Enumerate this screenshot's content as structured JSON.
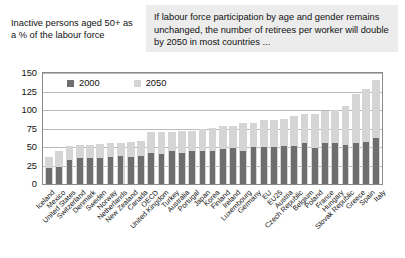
{
  "caption": "Inactive persons aged 50+ as a % of the labour force",
  "callout": "If labour force participation by age and gender remains unchanged, the number of retirees per worker will double by 2050 in most countries ...",
  "legend": [
    {
      "label": "2000",
      "color": "#6e6e6e"
    },
    {
      "label": "2050",
      "color": "#d5d5d5"
    }
  ],
  "colors": {
    "series_2000": "#6e6e6e",
    "series_2050": "#d5d5d5",
    "callout_bg": "#ececec",
    "gridline": "#b9b9b9",
    "frame": "#8a8a8a"
  },
  "chart_data": {
    "type": "bar",
    "title": "Inactive persons aged 50+ as a % of the labour force",
    "xlabel": "",
    "ylabel": "",
    "ylim": [
      0,
      150
    ],
    "yticks": [
      0,
      25,
      50,
      75,
      100,
      125,
      150
    ],
    "grid": true,
    "legend_position": "top-left",
    "categories": [
      "Iceland",
      "Mexico",
      "United States",
      "Switzerland",
      "Denmark",
      "Sweden",
      "Norway",
      "Netherlands",
      "New Zealand",
      "Canada",
      "OECD",
      "United Kingdom",
      "Turkey",
      "Australia",
      "Portugal",
      "Japan",
      "Korea",
      "Finland",
      "Ireland",
      "Luxembourg",
      "Germany",
      "EU",
      "EU25",
      "Austria",
      "Czech Republic",
      "Belgium",
      "Poland",
      "France",
      "Hungary",
      "Slovak Republic",
      "Greece",
      "Spain",
      "Italy"
    ],
    "series": [
      {
        "name": "2000",
        "values": [
          22,
          23,
          33,
          35,
          35,
          35,
          36,
          38,
          36,
          38,
          42,
          41,
          44,
          42,
          45,
          45,
          45,
          47,
          48,
          44,
          50,
          50,
          50,
          52,
          52,
          55,
          48,
          55,
          55,
          53,
          55,
          57,
          62
        ]
      },
      {
        "name": "2050",
        "values": [
          37,
          45,
          52,
          53,
          53,
          54,
          55,
          56,
          57,
          58,
          70,
          70,
          70,
          72,
          72,
          75,
          76,
          78,
          78,
          82,
          83,
          86,
          87,
          88,
          92,
          94,
          95,
          98,
          100,
          105,
          122,
          128,
          140
        ]
      }
    ]
  }
}
